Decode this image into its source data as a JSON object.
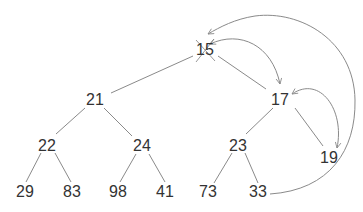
{
  "diagram": {
    "colors": {
      "edge": "#8a8a8a",
      "text": "#333333",
      "arrow": "#8a8a8a",
      "cross": "#9a9a9a"
    },
    "nodes": [
      {
        "id": "n15",
        "label": "15",
        "x": 205,
        "y": 50,
        "crossed_out": true
      },
      {
        "id": "n21",
        "label": "21",
        "x": 95,
        "y": 100
      },
      {
        "id": "n17",
        "label": "17",
        "x": 280,
        "y": 100
      },
      {
        "id": "n22",
        "label": "22",
        "x": 47,
        "y": 146
      },
      {
        "id": "n24",
        "label": "24",
        "x": 142,
        "y": 146
      },
      {
        "id": "n23",
        "label": "23",
        "x": 238,
        "y": 146
      },
      {
        "id": "n19",
        "label": "19",
        "x": 329,
        "y": 158
      },
      {
        "id": "n29",
        "label": "29",
        "x": 25,
        "y": 192
      },
      {
        "id": "n83",
        "label": "83",
        "x": 72,
        "y": 192
      },
      {
        "id": "n98",
        "label": "98",
        "x": 118,
        "y": 192
      },
      {
        "id": "n41",
        "label": "41",
        "x": 165,
        "y": 192
      },
      {
        "id": "n73",
        "label": "73",
        "x": 208,
        "y": 192
      },
      {
        "id": "n33",
        "label": "33",
        "x": 258,
        "y": 192
      }
    ],
    "edges": [
      [
        "n15",
        "n21"
      ],
      [
        "n15",
        "n17"
      ],
      [
        "n21",
        "n22"
      ],
      [
        "n21",
        "n24"
      ],
      [
        "n17",
        "n23"
      ],
      [
        "n17",
        "n19"
      ],
      [
        "n22",
        "n29"
      ],
      [
        "n22",
        "n83"
      ],
      [
        "n24",
        "n98"
      ],
      [
        "n24",
        "n41"
      ],
      [
        "n23",
        "n73"
      ],
      [
        "n23",
        "n33"
      ]
    ],
    "arrows": [
      {
        "from": "n33",
        "to": "n15",
        "kind": "move-last-to-root"
      },
      {
        "from": "n15",
        "to": "n17",
        "kind": "swap",
        "bidirectional": true
      },
      {
        "from": "n17",
        "to": "n19",
        "kind": "swap",
        "bidirectional": true
      }
    ]
  }
}
